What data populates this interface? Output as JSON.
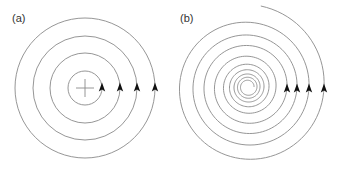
{
  "figure": {
    "panels": [
      {
        "label": "(a)",
        "type": "concentric-circles",
        "center": [
          85,
          88
        ],
        "radii": [
          17,
          35,
          52,
          70
        ],
        "arrow_direction": "up",
        "center_marker": "plus",
        "plus_half_size": 9
      },
      {
        "label": "(b)",
        "type": "spiral",
        "center": [
          248,
          87
        ],
        "arrow_x": [
          287,
          297,
          309,
          324
        ],
        "arrow_direction": "up"
      }
    ],
    "colors": {
      "line": "#8a8a8a",
      "arrow": "#111111",
      "label": "#333333"
    }
  }
}
